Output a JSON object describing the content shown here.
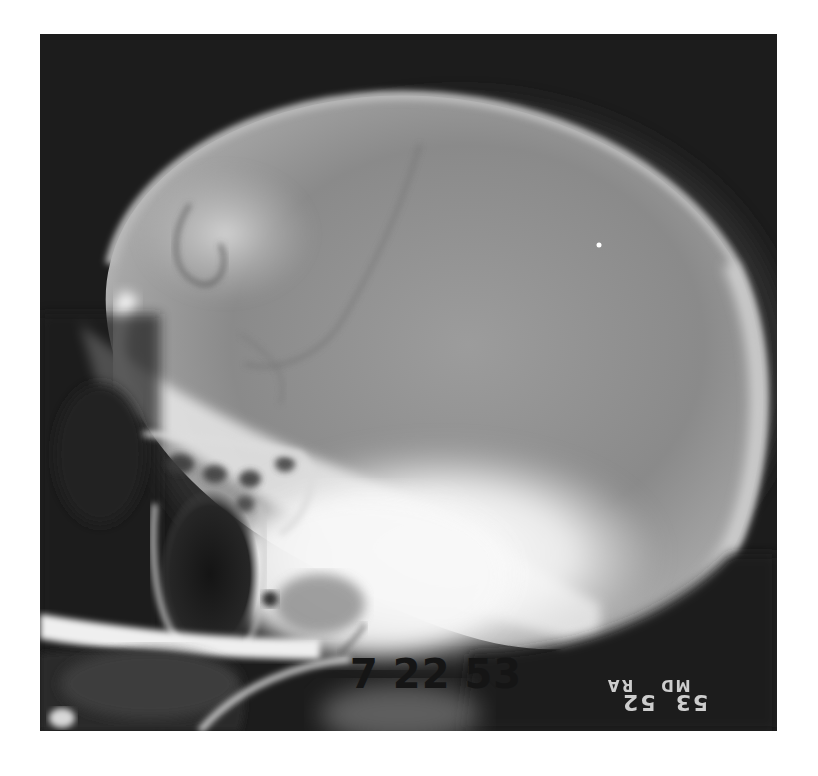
{
  "image": {
    "subject": "Lateral skull radiograph (X-ray)",
    "background_color": "#ffffff",
    "film_color": "#1a1a1a",
    "bone_color": "#f2f2f2"
  },
  "annotations": {
    "date_stamp": {
      "parts": [
        "7",
        "22",
        "53"
      ],
      "text": "7 22 53"
    },
    "film_marker": {
      "top_line": [
        "53",
        "52"
      ],
      "bottom_line": [
        "MD",
        "RA"
      ],
      "orientation": "mirrored"
    }
  }
}
